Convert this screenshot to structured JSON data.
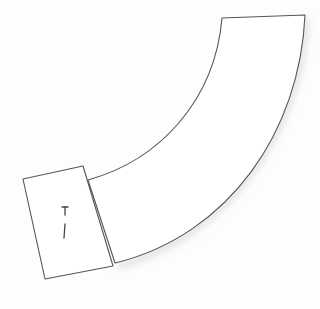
{
  "drawing": {
    "description": "Hand-drawn sketch of a curved pipe/elbow with a rectangular end cap",
    "stroke_color": "#555555",
    "background_color": "#fdfdfd",
    "cap_marks": "T\n/"
  }
}
